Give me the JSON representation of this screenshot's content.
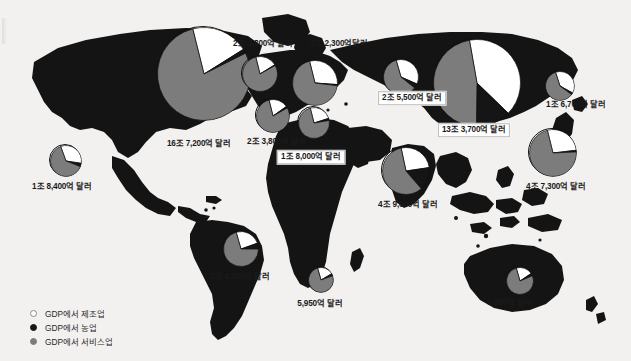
{
  "figure": {
    "background": "#f2f1ef",
    "land_color": "#141414",
    "currency_unit": "달러"
  },
  "legend": {
    "items": [
      {
        "marker": "white-circle-icon",
        "color": "#ffffff",
        "label": "GDP에서 제조업"
      },
      {
        "marker": "black-circle-icon",
        "color": "#151515",
        "label": "GDP에서 농업"
      },
      {
        "marker": "gray-circle-icon",
        "color": "#7c7c7c",
        "label": "GDP에서 서비스업"
      }
    ]
  },
  "chart_data": {
    "type": "pie",
    "categories": [
      "GDP에서 제조업",
      "GDP에서 농업",
      "GDP에서 서비스업"
    ],
    "colors": {
      "manufacturing": "#ffffff",
      "agriculture": "#151515",
      "services": "#7c7c7c"
    },
    "legend_position": "bottom-left",
    "grid": false,
    "pies": [
      {
        "id": "usa",
        "label": "16조 7,200억 달러",
        "value_usd_trillions": 16.72,
        "cx": 203,
        "cy": 73,
        "r": 47,
        "label_x": 199,
        "label_y": 144,
        "boxed": false,
        "slices": {
          "manufacturing": 20,
          "agriculture": 1.5,
          "services": 78.5
        },
        "start_angle": -14
      },
      {
        "id": "mexico",
        "label": "1조 8,400억 달러",
        "value_usd_trillions": 1.84,
        "cx": 65,
        "cy": 160,
        "r": 16,
        "label_x": 62,
        "label_y": 187,
        "boxed": false,
        "slices": {
          "manufacturing": 33,
          "agriculture": 3.5,
          "services": 63.5
        },
        "start_angle": -20
      },
      {
        "id": "brazil",
        "label": "2조 4,200억 달러",
        "value_usd_trillions": 2.42,
        "cx": 240,
        "cy": 248,
        "r": 18,
        "label_x": 240,
        "label_y": 277,
        "boxed": false,
        "slices": {
          "manufacturing": 24,
          "agriculture": 5.5,
          "services": 70.5
        },
        "start_angle": -16
      },
      {
        "id": "uk",
        "label": "2조 3,800억 달러",
        "value_usd_trillions": 2.38,
        "cx": 259,
        "cy": 73,
        "r": 18,
        "label_x": 263,
        "label_y": 44,
        "boxed": false,
        "slices": {
          "manufacturing": 20,
          "agriculture": 0.7,
          "services": 79.3
        },
        "start_angle": -14
      },
      {
        "id": "germany",
        "label": "3조 2,300억달러",
        "value_usd_trillions": 3.23,
        "cx": 314,
        "cy": 82,
        "r": 23,
        "label_x": 339,
        "label_y": 44,
        "boxed": false,
        "slices": {
          "manufacturing": 30,
          "agriculture": 0.8,
          "services": 69.2
        },
        "start_angle": -14
      },
      {
        "id": "france",
        "label": "2조 3,800억 달러",
        "value_usd_trillions": 2.38,
        "cx": 272,
        "cy": 115,
        "r": 17,
        "label_x": 277,
        "label_y": 142,
        "boxed": false,
        "slices": {
          "manufacturing": 19,
          "agriculture": 1.7,
          "services": 79.3
        },
        "start_angle": -14
      },
      {
        "id": "italy",
        "label": "1조 8,000억 달러",
        "value_usd_trillions": 1.8,
        "cx": 313,
        "cy": 122,
        "r": 16,
        "label_x": 311,
        "label_y": 157,
        "boxed": true,
        "slices": {
          "manufacturing": 24,
          "agriculture": 2.2,
          "services": 73.8
        },
        "start_angle": -14
      },
      {
        "id": "russia",
        "label": "2조 5,500억 달러",
        "value_usd_trillions": 2.55,
        "cx": 400,
        "cy": 76,
        "r": 18,
        "label_x": 412,
        "label_y": 98,
        "boxed": true,
        "slices": {
          "manufacturing": 36,
          "agriculture": 4.2,
          "services": 59.8
        },
        "start_angle": -16
      },
      {
        "id": "china",
        "label": "13조 3,700억 달러",
        "value_usd_trillions": 13.37,
        "cx": 476,
        "cy": 82,
        "r": 44,
        "label_x": 474,
        "label_y": 130,
        "boxed": true,
        "slices": {
          "manufacturing": 40,
          "agriculture": 13,
          "services": 47
        },
        "start_angle": -10
      },
      {
        "id": "korea",
        "label": "1조 6,700억 달러",
        "value_usd_trillions": 1.67,
        "cx": 559,
        "cy": 85,
        "r": 15,
        "label_x": 576,
        "label_y": 105,
        "boxed": false,
        "slices": {
          "manufacturing": 38,
          "agriculture": 2.2,
          "services": 59.8
        },
        "start_angle": -18
      },
      {
        "id": "japan",
        "label": "4조 7,300억 달러",
        "value_usd_trillions": 4.73,
        "cx": 552,
        "cy": 152,
        "r": 24,
        "label_x": 556,
        "label_y": 187,
        "boxed": false,
        "slices": {
          "manufacturing": 27,
          "agriculture": 1.2,
          "services": 71.8
        },
        "start_angle": -14
      },
      {
        "id": "india",
        "label": "4조 9,600억 달러",
        "value_usd_trillions": 4.96,
        "cx": 405,
        "cy": 170,
        "r": 24,
        "label_x": 408,
        "label_y": 205,
        "boxed": false,
        "slices": {
          "manufacturing": 26,
          "agriculture": 16,
          "services": 58
        },
        "start_angle": -12
      },
      {
        "id": "south-africa",
        "label": "5,950억 달러",
        "value_usd_trillions": 0.595,
        "cx": 320,
        "cy": 279,
        "r": 13,
        "label_x": 320,
        "label_y": 304,
        "boxed": false,
        "slices": {
          "manufacturing": 21,
          "agriculture": 3,
          "services": 76
        },
        "start_angle": -16
      },
      {
        "id": "australia",
        "label": "9,980억 달러",
        "value_usd_trillions": 0.998,
        "cx": 519,
        "cy": 280,
        "r": 14,
        "label_x": 510,
        "label_y": 303,
        "boxed": false,
        "slices": {
          "manufacturing": 20,
          "agriculture": 3,
          "services": 77
        },
        "start_angle": -16
      }
    ]
  }
}
